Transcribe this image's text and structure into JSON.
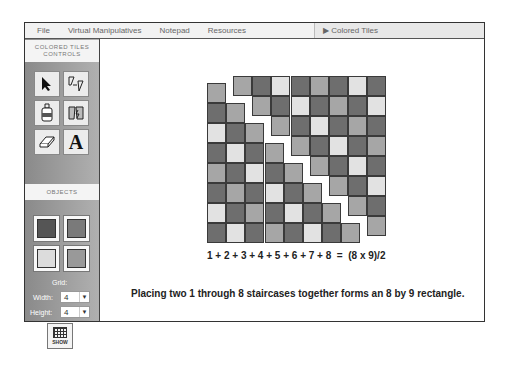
{
  "menubar": {
    "items": [
      "File",
      "Virtual Manipulatives",
      "Notepad",
      "Resources"
    ],
    "window_title": "▶ Colored Tiles"
  },
  "sidebar": {
    "controls_header": "COLORED TILES CONTROLS",
    "tools": [
      {
        "name": "select-arrow",
        "glyph": "➤"
      },
      {
        "name": "rotate-flip",
        "glyph": "◿"
      },
      {
        "name": "paint-bucket",
        "glyph": "🖌"
      },
      {
        "name": "duplicate",
        "glyph": "▚"
      },
      {
        "name": "eraser",
        "glyph": "⌫"
      },
      {
        "name": "text",
        "glyph": "A"
      }
    ],
    "objects_header": "OBJECTS",
    "objects": [
      {
        "name": "dark-tile",
        "color": "#555555"
      },
      {
        "name": "medium-dark-tile",
        "color": "#7a7a7a"
      },
      {
        "name": "light-tile",
        "color": "#dcdcdc"
      },
      {
        "name": "medium-tile",
        "color": "#999999"
      }
    ],
    "grid": {
      "label": "Grid:",
      "width_label": "Width:",
      "width_value": "4",
      "height_label": "Height:",
      "height_value": "4",
      "show_label": "SHOW"
    }
  },
  "canvas": {
    "equation": "1 + 2 + 3 + 4 + 5 + 6 + 7 + 8  =  (8 x 9)/2",
    "caption": "Placing two 1 through 8 staircases together forms an 8 by 9 rectangle.",
    "colors": {
      "dark": "#6e6e6e",
      "mid": "#a6a6a6",
      "light": "#e2e2e2"
    },
    "left_staircase": [
      [
        "mid"
      ],
      [
        "dark",
        "mid"
      ],
      [
        "light",
        "dark",
        "mid"
      ],
      [
        "dark",
        "light",
        "dark",
        "mid"
      ],
      [
        "mid",
        "dark",
        "light",
        "dark",
        "mid"
      ],
      [
        "dark",
        "mid",
        "dark",
        "light",
        "dark",
        "mid"
      ],
      [
        "light",
        "dark",
        "mid",
        "dark",
        "light",
        "dark",
        "mid"
      ],
      [
        "dark",
        "light",
        "dark",
        "mid",
        "dark",
        "light",
        "dark",
        "mid"
      ]
    ],
    "right_staircase": [
      [
        "mid",
        "dark",
        "light",
        "dark",
        "mid",
        "dark",
        "light",
        "dark"
      ],
      [
        "mid",
        "dark",
        "light",
        "dark",
        "mid",
        "dark",
        "light"
      ],
      [
        "mid",
        "dark",
        "light",
        "dark",
        "mid",
        "dark"
      ],
      [
        "mid",
        "dark",
        "light",
        "dark",
        "mid"
      ],
      [
        "mid",
        "dark",
        "light",
        "dark"
      ],
      [
        "mid",
        "dark",
        "light"
      ],
      [
        "mid",
        "dark"
      ],
      [
        "mid"
      ]
    ]
  }
}
